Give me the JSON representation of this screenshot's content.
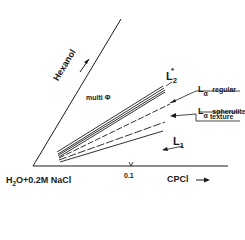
{
  "diagram": {
    "type": "phase-diagram",
    "axes": {
      "vertical_axis_label": "Hexanol",
      "horizontal_axis_label": "CPCl",
      "origin_label": "H2O+0.2M NaCl",
      "origin_label_parts": {
        "h": "H",
        "sub": "2",
        "rest": "O+0.2M NaCl"
      },
      "tick_label": "0.1"
    },
    "regions": {
      "multi_phase": "multi Φ",
      "l2_star": {
        "main": "L",
        "sub": "2",
        "sup": "*"
      },
      "l_alpha_regular": {
        "main": "L",
        "sub": "α",
        "suffix": "regular"
      },
      "l_alpha_spherulite": {
        "main": "L",
        "sub": "α",
        "suffix": "spherulite",
        "line2": "texture"
      },
      "l1": {
        "main": "L",
        "sub": "1"
      }
    },
    "colors": {
      "ink": "#1a1a1a",
      "background": "#ffffff"
    }
  }
}
